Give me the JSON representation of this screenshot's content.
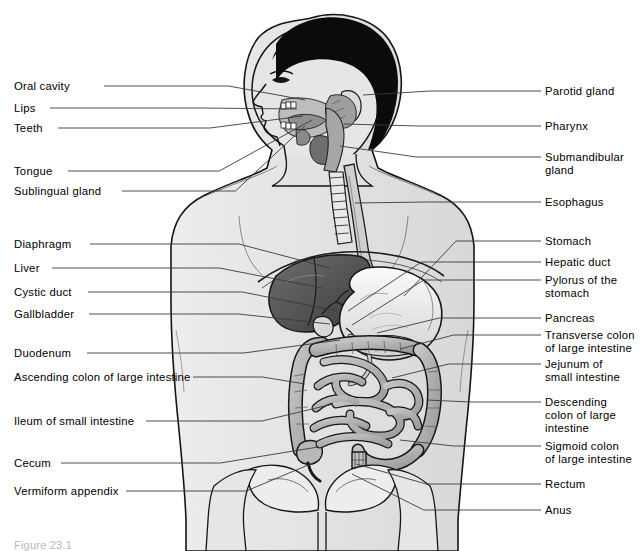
{
  "figure": {
    "caption": "Figure 23.1",
    "view": "sagittal-anterior composite, male torso facing left"
  },
  "colors": {
    "background": "#ffffff",
    "line": "#1a1a1a",
    "leader_line": "#3a3a3a",
    "text": "#000000",
    "body_fill": "#e3e3e3",
    "body_outline": "#111111",
    "hair": "#0b0b0b",
    "liver": "#5d5d5d",
    "liver_dark": "#3f3f3f",
    "stomach": "#f2f2f2",
    "stomach_shade": "#c9c9c9",
    "intestine": "#b4b4b4",
    "intestine_shade": "#9a9a9a",
    "organ_mid": "#a8a8a8",
    "bone": "#ededed",
    "caption_text": "#b9b9b9"
  },
  "labels_left": [
    {
      "id": "oral-cavity",
      "text": "Oral cavity",
      "x": 14,
      "y": 80,
      "anchor_x": 104,
      "anchor_y": 86,
      "target_x": 305,
      "target_y": 100
    },
    {
      "id": "lips",
      "text": "Lips",
      "x": 14,
      "y": 102,
      "anchor_x": 50,
      "anchor_y": 108,
      "target_x": 297,
      "target_y": 109
    },
    {
      "id": "teeth",
      "text": "Teeth",
      "x": 14,
      "y": 122,
      "anchor_x": 58,
      "anchor_y": 128,
      "target_x": 303,
      "target_y": 116
    },
    {
      "id": "tongue",
      "text": "Tongue",
      "x": 14,
      "y": 165,
      "anchor_x": 68,
      "anchor_y": 171,
      "target_x": 312,
      "target_y": 120
    },
    {
      "id": "sublingual-gland",
      "text": "Sublingual gland",
      "x": 14,
      "y": 185,
      "anchor_x": 122,
      "anchor_y": 191,
      "target_x": 305,
      "target_y": 126
    },
    {
      "id": "diaphragm",
      "text": "Diaphragm",
      "x": 14,
      "y": 238,
      "anchor_x": 90,
      "anchor_y": 244,
      "target_x": 330,
      "target_y": 268
    },
    {
      "id": "liver",
      "text": "Liver",
      "x": 14,
      "y": 262,
      "anchor_x": 52,
      "anchor_y": 268,
      "target_x": 322,
      "target_y": 288
    },
    {
      "id": "cystic-duct",
      "text": "Cystic duct",
      "x": 14,
      "y": 286,
      "anchor_x": 88,
      "anchor_y": 292,
      "target_x": 337,
      "target_y": 311
    },
    {
      "id": "gallbladder",
      "text": "Gallbladder",
      "x": 14,
      "y": 308,
      "anchor_x": 89,
      "anchor_y": 314,
      "target_x": 330,
      "target_y": 324
    },
    {
      "id": "duodenum",
      "text": "Duodenum",
      "x": 14,
      "y": 347,
      "anchor_x": 87,
      "anchor_y": 353,
      "target_x": 340,
      "target_y": 340
    },
    {
      "id": "ascending-colon",
      "text": "Ascending colon of large intestine",
      "x": 14,
      "y": 371,
      "anchor_x": 193,
      "anchor_y": 377,
      "target_x": 305,
      "target_y": 384
    },
    {
      "id": "ileum",
      "text": "Ileum of small intestine",
      "x": 14,
      "y": 415,
      "anchor_x": 146,
      "anchor_y": 421,
      "target_x": 333,
      "target_y": 404
    },
    {
      "id": "cecum",
      "text": "Cecum",
      "x": 14,
      "y": 457,
      "anchor_x": 61,
      "anchor_y": 463,
      "target_x": 318,
      "target_y": 447
    },
    {
      "id": "vermiform-appendix",
      "text": "Vermiform appendix",
      "x": 14,
      "y": 485,
      "anchor_x": 126,
      "anchor_y": 491,
      "target_x": 320,
      "target_y": 460
    }
  ],
  "labels_right": [
    {
      "id": "parotid-gland",
      "text": "Parotid gland",
      "x": 545,
      "y": 85,
      "anchor_x": 541,
      "anchor_y": 91,
      "target_x": 363,
      "target_y": 95
    },
    {
      "id": "pharynx",
      "text": "Pharynx",
      "x": 545,
      "y": 120,
      "anchor_x": 541,
      "anchor_y": 126,
      "target_x": 344,
      "target_y": 124
    },
    {
      "id": "submandibular-gland",
      "text": "Submandibular\ngland",
      "x": 545,
      "y": 151,
      "anchor_x": 541,
      "anchor_y": 157,
      "target_x": 340,
      "target_y": 146
    },
    {
      "id": "esophagus",
      "text": "Esophagus",
      "x": 545,
      "y": 196,
      "anchor_x": 541,
      "anchor_y": 202,
      "target_x": 355,
      "target_y": 203
    },
    {
      "id": "stomach",
      "text": "Stomach",
      "x": 545,
      "y": 235,
      "anchor_x": 541,
      "anchor_y": 241,
      "target_x": 404,
      "target_y": 296
    },
    {
      "id": "hepatic-duct",
      "text": "Hepatic duct",
      "x": 545,
      "y": 256,
      "anchor_x": 541,
      "anchor_y": 262,
      "target_x": 348,
      "target_y": 311
    },
    {
      "id": "pylorus",
      "text": "Pylorus of the\nstomach",
      "x": 545,
      "y": 274,
      "anchor_x": 541,
      "anchor_y": 280,
      "target_x": 352,
      "target_y": 325
    },
    {
      "id": "pancreas",
      "text": "Pancreas",
      "x": 545,
      "y": 312,
      "anchor_x": 541,
      "anchor_y": 318,
      "target_x": 377,
      "target_y": 333
    },
    {
      "id": "transverse-colon",
      "text": "Transverse colon\nof large intestine",
      "x": 545,
      "y": 329,
      "anchor_x": 541,
      "anchor_y": 335,
      "target_x": 400,
      "target_y": 349
    },
    {
      "id": "jejunum",
      "text": "Jejunum of\nsmall intestine",
      "x": 545,
      "y": 358,
      "anchor_x": 541,
      "anchor_y": 364,
      "target_x": 392,
      "target_y": 378
    },
    {
      "id": "descending-colon",
      "text": "Descending\ncolon of large\nintestine",
      "x": 545,
      "y": 396,
      "anchor_x": 541,
      "anchor_y": 402,
      "target_x": 427,
      "target_y": 400
    },
    {
      "id": "sigmoid-colon",
      "text": "Sigmoid colon\nof large intestine",
      "x": 545,
      "y": 440,
      "anchor_x": 541,
      "anchor_y": 446,
      "target_x": 400,
      "target_y": 440
    },
    {
      "id": "rectum",
      "text": "Rectum",
      "x": 545,
      "y": 478,
      "anchor_x": 541,
      "anchor_y": 484,
      "target_x": 356,
      "target_y": 464
    },
    {
      "id": "anus",
      "text": "Anus",
      "x": 545,
      "y": 504,
      "anchor_x": 541,
      "anchor_y": 510,
      "target_x": 352,
      "target_y": 474
    }
  ]
}
